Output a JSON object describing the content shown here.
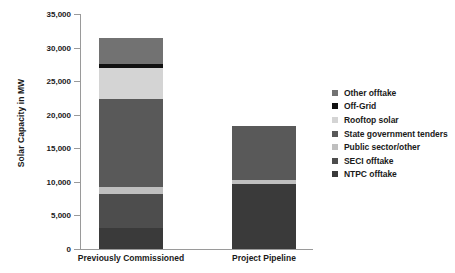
{
  "chart_data": {
    "type": "bar",
    "subtype": "stacked-column",
    "title": "",
    "xlabel": "",
    "ylabel": "Solar Capacity in MW",
    "ylim": [
      0,
      35000
    ],
    "ytick_values": [
      0,
      5000,
      10000,
      15000,
      20000,
      25000,
      30000,
      35000
    ],
    "ytick_labels": [
      "0",
      "5,000",
      "10,000",
      "15,000",
      "20,000",
      "25,000",
      "30,000",
      "35,000"
    ],
    "grid": false,
    "legend_position": "right",
    "categories": [
      "Previously Commissioned",
      "Project Pipeline"
    ],
    "series": [
      {
        "name": "NTPC offtake",
        "color": "#3a3a3a",
        "values": [
          3200,
          9700
        ]
      },
      {
        "name": "SECI offtake",
        "color": "#4d4d4d",
        "values": [
          5000,
          0
        ]
      },
      {
        "name": "Public sector/other",
        "color": "#bfbfbf",
        "values": [
          1000,
          600
        ]
      },
      {
        "name": "State government tenders",
        "color": "#595959",
        "values": [
          13100,
          8000
        ]
      },
      {
        "name": "Rooftop solar",
        "color": "#d4d4d4",
        "values": [
          4700,
          0
        ]
      },
      {
        "name": "Off-Grid",
        "color": "#111111",
        "values": [
          500,
          0
        ]
      },
      {
        "name": "Other offtake",
        "color": "#727272",
        "values": [
          4000,
          0
        ]
      }
    ],
    "totals": [
      31500,
      18300
    ]
  },
  "legend": {
    "items": [
      {
        "label": "Other offtake",
        "color": "#727272"
      },
      {
        "label": "Off-Grid",
        "color": "#111111"
      },
      {
        "label": "Rooftop solar",
        "color": "#d4d4d4"
      },
      {
        "label": "State government tenders",
        "color": "#595959"
      },
      {
        "label": "Public sector/other",
        "color": "#bfbfbf"
      },
      {
        "label": "SECI offtake",
        "color": "#4d4d4d"
      },
      {
        "label": "NTPC offtake",
        "color": "#3a3a3a"
      }
    ]
  },
  "axis": {
    "line_color": "#9a9a9a"
  }
}
